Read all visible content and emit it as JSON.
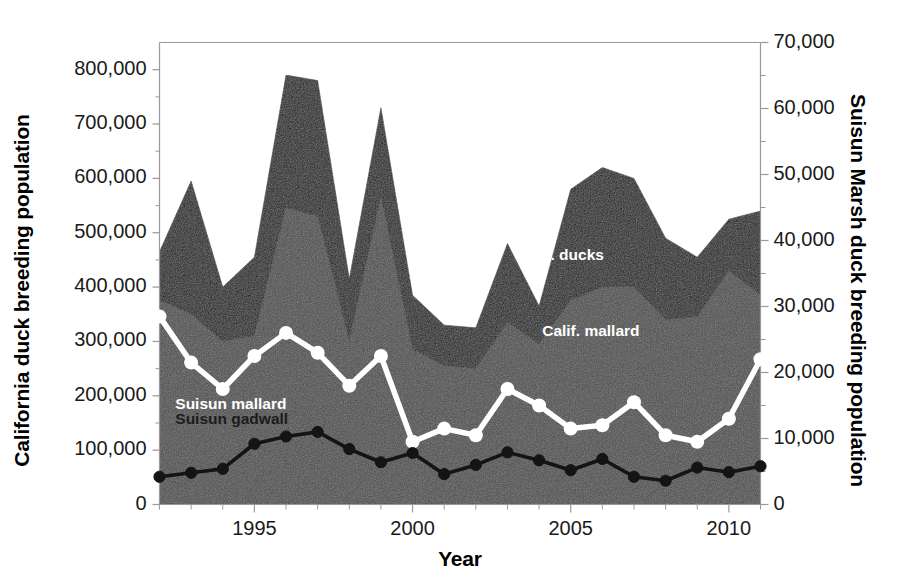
{
  "chart_data": {
    "type": "area",
    "title": "",
    "xlabel": "Year",
    "ylabel": "California duck breeding population",
    "ylabel_right": "Suisun Marsh duck breeding population",
    "x": [
      1992,
      1993,
      1994,
      1995,
      1996,
      1997,
      1998,
      1999,
      2000,
      2001,
      2002,
      2003,
      2004,
      2005,
      2006,
      2007,
      2008,
      2009,
      2010,
      2011
    ],
    "xlim": [
      1992,
      2011
    ],
    "ylim": [
      0,
      850000
    ],
    "ylim_right": [
      0,
      70000
    ],
    "xticks": [
      1995,
      2000,
      2005,
      2010
    ],
    "xtick_labels": [
      "1995",
      "2000",
      "2005",
      "2010"
    ],
    "xtick_minor_interval": 1,
    "yticks_left": [
      0,
      100000,
      200000,
      300000,
      400000,
      500000,
      600000,
      700000,
      800000
    ],
    "ytick_labels_left": [
      "0",
      "100,000",
      "200,000",
      "300,000",
      "400,000",
      "500,000",
      "600,000",
      "700,000",
      "800,000"
    ],
    "yticks_right": [
      0,
      10000,
      20000,
      30000,
      40000,
      50000,
      60000,
      70000
    ],
    "ytick_labels_right": [
      "0",
      "10,000",
      "20,000",
      "30,000",
      "40,000",
      "50,000",
      "60,000",
      "70,000"
    ],
    "ytick_right_minor_interval": 5000,
    "grid": false,
    "legend_position": "inline-annotations",
    "series": [
      {
        "name": "Calif. ducks",
        "label": "Calif. ducks",
        "kind": "area",
        "axis": "left",
        "color": "#161616",
        "label_x": 2003.3,
        "label_y": 450000,
        "label_color": "#ffffff",
        "values": [
          465000,
          595000,
          400000,
          455000,
          790000,
          780000,
          415000,
          730000,
          385000,
          330000,
          325000,
          480000,
          365000,
          580000,
          620000,
          600000,
          490000,
          455000,
          525000,
          540000
        ]
      },
      {
        "name": "Calif. mallard",
        "label": "Calif. mallard",
        "kind": "area",
        "axis": "left",
        "color": "#4a4a4a",
        "label_x": 2004.1,
        "label_y": 310000,
        "label_color": "#ffffff",
        "values": [
          375000,
          350000,
          300000,
          310000,
          545000,
          530000,
          300000,
          565000,
          285000,
          255000,
          250000,
          335000,
          295000,
          375000,
          400000,
          400000,
          340000,
          345000,
          430000,
          385000
        ]
      },
      {
        "name": "Suisun mallard",
        "label": "Suisun mallard",
        "kind": "line",
        "axis": "right",
        "color": "#ffffff",
        "marker": "circle",
        "label_x": 1992.5,
        "label_y": 14500,
        "label_color": "#ffffff",
        "values": [
          28500,
          21500,
          17500,
          22500,
          26000,
          23000,
          18000,
          22500,
          9500,
          11500,
          10500,
          17500,
          15000,
          11500,
          12000,
          15500,
          10500,
          9500,
          13000,
          22000
        ]
      },
      {
        "name": "Suisun gadwall",
        "label": "Suisun gadwall",
        "kind": "line",
        "axis": "right",
        "color": "#141414",
        "marker": "circle",
        "label_x": 1992.5,
        "label_y": 12200,
        "label_color": "#1c1c1c",
        "values": [
          4200,
          4800,
          5400,
          9200,
          10300,
          11000,
          8400,
          6400,
          7800,
          4600,
          6000,
          7900,
          6700,
          5200,
          6900,
          4200,
          3600,
          5600,
          4900,
          5800
        ]
      }
    ],
    "annotations": [
      {
        "text": "Calif. ducks",
        "color": "#ffffff"
      },
      {
        "text": "Calif. mallard",
        "color": "#ffffff"
      },
      {
        "text": "Suisun mallard",
        "color": "#ffffff"
      },
      {
        "text": "Suisun gadwall",
        "color": "#1c1c1c"
      }
    ],
    "colors": {
      "ducks_area": "#161616",
      "mallard_area": "#4a4a4a",
      "suisun_mallard_line": "#ffffff",
      "suisun_gadwall_line": "#141414",
      "axis": "#9a9a9a",
      "text": "#1a1a1a",
      "background": "#ffffff"
    }
  }
}
